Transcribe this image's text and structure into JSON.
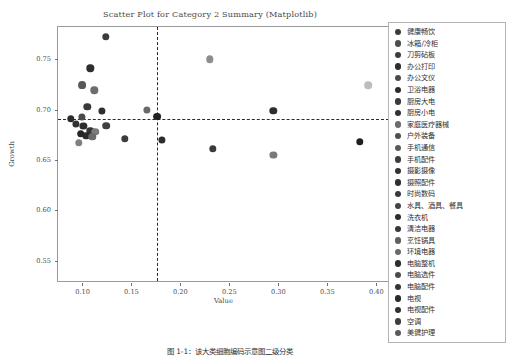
{
  "chart": {
    "title": "Scatter Plot for Category 2 Summary (Matplotlib)",
    "caption": "图 1-1：该大类细胞编码示意图二级分类",
    "xlabel": "Value",
    "ylabel": "Growth"
  },
  "chart_data": {
    "type": "scatter",
    "title": "Scatter Plot for Category 2 Summary (Matplotlib)",
    "xlabel": "Value",
    "ylabel": "Growth",
    "xlim": [
      0.075,
      0.415
    ],
    "ylim": [
      0.528,
      0.782
    ],
    "xticks": [
      "0.10",
      "0.15",
      "0.20",
      "0.25",
      "0.30",
      "0.35",
      "0.40"
    ],
    "xtick_values": [
      0.1,
      0.15,
      0.2,
      0.25,
      0.3,
      0.35,
      0.4
    ],
    "yticks": [
      "0.55",
      "0.60",
      "0.65",
      "0.70",
      "0.75"
    ],
    "ytick_values": [
      0.55,
      0.6,
      0.65,
      0.7,
      0.75
    ],
    "grid": false,
    "legend_position": "right",
    "reference_lines": {
      "vertical_x": 0.176,
      "horizontal_y": 0.691,
      "style": "dashed",
      "color": "#2b2b2b"
    },
    "points": [
      {
        "label": "健康畅饮",
        "x": 0.124,
        "y": 0.772,
        "color": "#3b3b3b",
        "size": 7.4
      },
      {
        "label": "冰箱/冷柜",
        "x": 0.108,
        "y": 0.741,
        "color": "#2e2e2e",
        "size": 7.4
      },
      {
        "label": "刀剪砧板",
        "x": 0.1,
        "y": 0.724,
        "color": "#585858",
        "size": 7.8
      },
      {
        "label": "办公打印",
        "x": 0.112,
        "y": 0.719,
        "color": "#6d6d6d",
        "size": 7.4
      },
      {
        "label": "办公文仪",
        "x": 0.23,
        "y": 0.75,
        "color": "#8d8d8d",
        "size": 7.4
      },
      {
        "label": "卫浴电器",
        "x": 0.105,
        "y": 0.703,
        "color": "#3a3a3a",
        "size": 7.4
      },
      {
        "label": "厨房大电",
        "x": 0.392,
        "y": 0.724,
        "color": "#bdbdbd",
        "size": 7.6
      },
      {
        "label": "厨房小电",
        "x": 0.12,
        "y": 0.699,
        "color": "#2f2f2f",
        "size": 7.2
      },
      {
        "label": "家庭医疗器械",
        "x": 0.166,
        "y": 0.7,
        "color": "#6a6a6a",
        "size": 7.2
      },
      {
        "label": "户外装备",
        "x": 0.176,
        "y": 0.693,
        "color": "#222222",
        "size": 7.8
      },
      {
        "label": "手机通信",
        "x": 0.088,
        "y": 0.691,
        "color": "#2b2b2b",
        "size": 7.4
      },
      {
        "label": "手机配件",
        "x": 0.093,
        "y": 0.686,
        "color": "#323232",
        "size": 7.2
      },
      {
        "label": "摄影摄像",
        "x": 0.101,
        "y": 0.684,
        "color": "#2d2d2d",
        "size": 7.2
      },
      {
        "label": "摄照配件",
        "x": 0.124,
        "y": 0.684,
        "color": "#3f3f3f",
        "size": 7.6
      },
      {
        "label": "时尚数码",
        "x": 0.108,
        "y": 0.679,
        "color": "#343434",
        "size": 7.4
      },
      {
        "label": "水具、酒具、餐具",
        "x": 0.113,
        "y": 0.678,
        "color": "#7b7b7b",
        "size": 7.4
      },
      {
        "label": "洗衣机",
        "x": 0.098,
        "y": 0.676,
        "color": "#262626",
        "size": 7.6
      },
      {
        "label": "清洁电器",
        "x": 0.104,
        "y": 0.674,
        "color": "#2a2a2a",
        "size": 7.4
      },
      {
        "label": "烹饪锅具",
        "x": 0.11,
        "y": 0.673,
        "color": "#6b6b6b",
        "size": 7.4
      },
      {
        "label": "环境电器",
        "x": 0.096,
        "y": 0.667,
        "color": "#7f7f7f",
        "size": 7.4
      },
      {
        "label": "电脑整机",
        "x": 0.143,
        "y": 0.671,
        "color": "#3c3c3c",
        "size": 7.4
      },
      {
        "label": "电脑选件",
        "x": 0.181,
        "y": 0.67,
        "color": "#2c2c2c",
        "size": 7.2
      },
      {
        "label": "电脑配件",
        "x": 0.295,
        "y": 0.699,
        "color": "#2e2e2e",
        "size": 7.4
      },
      {
        "label": "电视",
        "x": 0.295,
        "y": 0.655,
        "color": "#7a7a7a",
        "size": 7.2
      },
      {
        "label": "电视配件",
        "x": 0.383,
        "y": 0.668,
        "color": "#1f1f1f",
        "size": 7.4
      },
      {
        "label": "空调",
        "x": 0.233,
        "y": 0.661,
        "color": "#3a3a3a",
        "size": 7.4
      },
      {
        "label": "美健护理",
        "x": 0.099,
        "y": 0.693,
        "color": "#4a4a4a",
        "size": 7.2
      }
    ]
  },
  "legend": {
    "items": [
      {
        "label": "健康畅饮",
        "color": "#3b3b3b"
      },
      {
        "label": "冰箱/冷柜",
        "color": "#4e4e4e"
      },
      {
        "label": "刀剪砧板",
        "color": "#3d3d3d"
      },
      {
        "label": "办公打印",
        "color": "#2f2f2f"
      },
      {
        "label": "办公文仪",
        "color": "#4a4a4a"
      },
      {
        "label": "卫浴电器",
        "color": "#2b2b2b"
      },
      {
        "label": "厨房大电",
        "color": "#3a3a3a"
      },
      {
        "label": "厨房小电",
        "color": "#303030"
      },
      {
        "label": "家庭医疗器械",
        "color": "#6c6c6c"
      },
      {
        "label": "户外装备",
        "color": "#4f4f4f"
      },
      {
        "label": "手机通信",
        "color": "#5a5a5a"
      },
      {
        "label": "手机配件",
        "color": "#3c3c3c"
      },
      {
        "label": "摄影摄像",
        "color": "#333333"
      },
      {
        "label": "摄照配件",
        "color": "#2e2e2e"
      },
      {
        "label": "时尚数码",
        "color": "#3a3a3a"
      },
      {
        "label": "水具、酒具、餐具",
        "color": "#444444"
      },
      {
        "label": "洗衣机",
        "color": "#2c2c2c"
      },
      {
        "label": "清洁电器",
        "color": "#383838"
      },
      {
        "label": "烹饪锅具",
        "color": "#5f5f5f"
      },
      {
        "label": "环境电器",
        "color": "#6a6a6a"
      },
      {
        "label": "电脑整机",
        "color": "#2d2d2d"
      },
      {
        "label": "电脑选件",
        "color": "#4b4b4b"
      },
      {
        "label": "电脑配件",
        "color": "#343434"
      },
      {
        "label": "电视",
        "color": "#2a2a2a"
      },
      {
        "label": "电视配件",
        "color": "#303030"
      },
      {
        "label": "空调",
        "color": "#3e3e3e"
      },
      {
        "label": "美健护理",
        "color": "#5b5b5b"
      }
    ]
  }
}
